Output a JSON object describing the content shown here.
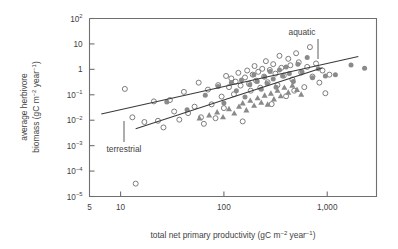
{
  "chart_data": {
    "type": "scatter",
    "title": "",
    "xlabel": "total net primary productivity (gC m-2 year-1)",
    "xlabel_parts": {
      "a": "total net primary productivity (gC m",
      "sup1": "−2",
      "b": " year",
      "sup2": "−1",
      "c": ")"
    },
    "ylabel": "average herbivore biomass (gC m-2 year-1)",
    "ylabel_line1": "average herbivore",
    "ylabel_line2_parts": {
      "a": "biomass (gC m",
      "sup1": "−2",
      "b": " year",
      "sup2": "−1",
      "c": ")"
    },
    "xscale": "log",
    "yscale": "log",
    "xlim": [
      5,
      3000
    ],
    "ylim": [
      1e-05,
      100
    ],
    "grid": false,
    "legend": "none",
    "xticks": [
      {
        "value": 5,
        "label": "5",
        "major": false
      },
      {
        "value": 10,
        "label": "10",
        "major": true
      },
      {
        "value": 100,
        "label": "100",
        "major": true
      },
      {
        "value": 1000,
        "label": "1,000",
        "major": true
      }
    ],
    "yticks": [
      {
        "value": 100,
        "mant": "10",
        "sup": "2"
      },
      {
        "value": 10,
        "mant": "10",
        "sup": ""
      },
      {
        "value": 1,
        "mant": "1",
        "sup": ""
      },
      {
        "value": 0.1,
        "mant": "10",
        "sup": "−1"
      },
      {
        "value": 0.01,
        "mant": "10",
        "sup": "−2"
      },
      {
        "value": 0.001,
        "mant": "10",
        "sup": "−3"
      },
      {
        "value": 0.0001,
        "mant": "10",
        "sup": "−4"
      },
      {
        "value": 1e-05,
        "mant": "10",
        "sup": "−5"
      }
    ],
    "annotations": [
      {
        "text": "aquatic",
        "x": 1050,
        "y": 6.0
      },
      {
        "text": "terrestrial",
        "x": 16,
        "y": 0.0011
      }
    ],
    "series": [
      {
        "name": "open-circle",
        "marker": "open-circle",
        "color": "#7d7d7d",
        "points": [
          [
            11,
            0.17
          ],
          [
            13,
            0.013
          ],
          [
            14,
            3.2e-05
          ],
          [
            17,
            0.0085
          ],
          [
            21,
            0.055
          ],
          [
            23,
            0.0095
          ],
          [
            26,
            0.0052
          ],
          [
            30,
            0.062
          ],
          [
            33,
            0.022
          ],
          [
            37,
            0.0105
          ],
          [
            41,
            0.13
          ],
          [
            45,
            0.019
          ],
          [
            52,
            0.034
          ],
          [
            57,
            0.3
          ],
          [
            60,
            0.013
          ],
          [
            64,
            0.0072
          ],
          [
            70,
            0.16
          ],
          [
            76,
            0.042
          ],
          [
            83,
            0.012
          ],
          [
            88,
            0.24
          ],
          [
            95,
            0.085
          ],
          [
            100,
            0.03
          ],
          [
            105,
            0.55
          ],
          [
            112,
            0.2
          ],
          [
            118,
            0.44
          ],
          [
            125,
            0.105
          ],
          [
            130,
            0.33
          ],
          [
            138,
            0.73
          ],
          [
            145,
            0.23
          ],
          [
            152,
            0.009
          ],
          [
            160,
            0.48
          ],
          [
            168,
            0.9
          ],
          [
            175,
            0.27
          ],
          [
            182,
            0.145
          ],
          [
            190,
            0.62
          ],
          [
            198,
            1.35
          ],
          [
            205,
            0.36
          ],
          [
            215,
            0.8
          ],
          [
            225,
            0.19
          ],
          [
            235,
            1.05
          ],
          [
            245,
            0.52
          ],
          [
            255,
            2.1
          ],
          [
            265,
            0.31
          ],
          [
            278,
            0.95
          ],
          [
            290,
            0.043
          ],
          [
            300,
            1.6
          ],
          [
            315,
            0.68
          ],
          [
            330,
            0.24
          ],
          [
            345,
            3.4
          ],
          [
            360,
            1.15
          ],
          [
            380,
            0.57
          ],
          [
            400,
            0.088
          ],
          [
            420,
            2.6
          ],
          [
            440,
            1.45
          ],
          [
            460,
            0.4
          ],
          [
            480,
            0.145
          ],
          [
            500,
            4.3
          ],
          [
            530,
            1.9
          ],
          [
            560,
            0.75
          ],
          [
            600,
            0.2
          ],
          [
            640,
            1.25
          ],
          [
            680,
            7.5
          ],
          [
            720,
            0.52
          ],
          [
            780,
            1.7
          ],
          [
            840,
            0.3
          ],
          [
            900,
            0.9
          ],
          [
            960,
            0.115
          ],
          [
            1050,
            0.62
          ]
        ]
      },
      {
        "name": "filled-circle",
        "marker": "filled-circle",
        "color": "#8a8a8a",
        "points": [
          [
            28,
            0.052
          ],
          [
            44,
            0.026
          ],
          [
            66,
            0.095
          ],
          [
            88,
            0.21
          ],
          [
            100,
            0.047
          ],
          [
            118,
            0.3
          ],
          [
            132,
            0.145
          ],
          [
            148,
            0.38
          ],
          [
            160,
            0.082
          ],
          [
            178,
            0.25
          ],
          [
            195,
            0.62
          ],
          [
            210,
            0.33
          ],
          [
            230,
            0.165
          ],
          [
            248,
            0.5
          ],
          [
            262,
            0.28
          ],
          [
            280,
            0.82
          ],
          [
            300,
            0.42
          ],
          [
            320,
            0.2
          ],
          [
            345,
            0.95
          ],
          [
            370,
            0.55
          ],
          [
            400,
            1.25
          ],
          [
            430,
            0.68
          ],
          [
            470,
            0.33
          ],
          [
            520,
            1.6
          ],
          [
            570,
            0.8
          ],
          [
            640,
            2.9
          ],
          [
            720,
            0.47
          ],
          [
            820,
            1.05
          ],
          [
            960,
            0.55
          ],
          [
            1200,
            0.62
          ],
          [
            1700,
            1.5
          ],
          [
            2300,
            1.1
          ]
        ]
      },
      {
        "name": "filled-triangle",
        "marker": "filled-triangle",
        "color": "#8a8a8a",
        "points": [
          [
            58,
            0.012
          ],
          [
            72,
            0.016
          ],
          [
            86,
            0.021
          ],
          [
            98,
            0.0135
          ],
          [
            112,
            0.028
          ],
          [
            126,
            0.019
          ],
          [
            140,
            0.035
          ],
          [
            152,
            0.047
          ],
          [
            165,
            0.025
          ],
          [
            180,
            0.06
          ],
          [
            196,
            0.038
          ],
          [
            212,
            0.075
          ],
          [
            230,
            0.05
          ],
          [
            248,
            0.095
          ],
          [
            265,
            0.042
          ],
          [
            285,
            0.115
          ],
          [
            305,
            0.068
          ],
          [
            330,
            0.15
          ],
          [
            355,
            0.09
          ],
          [
            385,
            0.195
          ],
          [
            420,
            0.125
          ],
          [
            460,
            0.235
          ],
          [
            510,
            0.16
          ],
          [
            560,
            0.105
          ]
        ]
      }
    ],
    "trendlines": [
      {
        "name": "aquatic",
        "label": "aquatic",
        "x1": 6.5,
        "y1": 0.0175,
        "x2": 2000,
        "y2": 3.2
      },
      {
        "name": "terrestrial",
        "label": "terrestrial",
        "x1": 14,
        "y1": 0.0046,
        "x2": 900,
        "y2": 1.15
      }
    ]
  }
}
